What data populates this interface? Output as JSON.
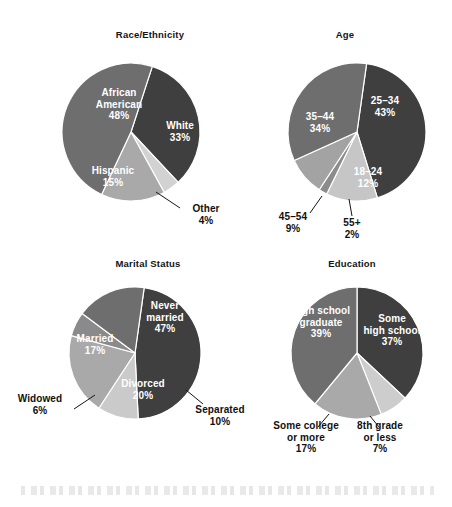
{
  "figure": {
    "width": 452,
    "height": 507,
    "background": "#ffffff"
  },
  "palette": {
    "darkest": "#3f3f3f",
    "dark": "#4a4a4a",
    "medium": "#6e6e6e",
    "light": "#9a9a9a",
    "lighter": "#b6b6b6",
    "lightest": "#d2d2d2",
    "label_light": "#ffffff",
    "label_dark": "#101010",
    "leader_line": "#141414"
  },
  "chart_data": [
    {
      "type": "pie",
      "title": "Race/Ethnicity",
      "center": {
        "x": 131,
        "y": 132
      },
      "radius": 69,
      "start_angle": 18,
      "direction": "clockwise",
      "labels": [
        "White",
        "Other",
        "Hispanic",
        "African American"
      ],
      "values": [
        33,
        4,
        15,
        48
      ],
      "slices": [
        {
          "label": "White",
          "value": 33,
          "value_text": "33%",
          "color": "#3f3f3f",
          "label_placement": "inside",
          "label_color": "#ffffff",
          "label_x": 180,
          "label_y": 131,
          "leader": null
        },
        {
          "label": "Other",
          "value": 4,
          "value_text": "4%",
          "color": "#d2d2d2",
          "label_placement": "outside",
          "label_color": "#101010",
          "label_x": 206,
          "label_y": 214,
          "leader": {
            "x1": 156,
            "y1": 192,
            "x2": 180,
            "y2": 208
          }
        },
        {
          "label": "Hispanic",
          "value": 15,
          "value_text": "15%",
          "color": "#a9a9a9",
          "label_placement": "inside",
          "label_color": "#ffffff",
          "label_x": 113,
          "label_y": 176,
          "leader": null
        },
        {
          "label": "African American",
          "value": 48,
          "value_text": "48%",
          "color": "#6e6e6e",
          "label_placement": "inside",
          "label_color": "#ffffff",
          "label_x": 119,
          "label_y": 104,
          "leader": null
        }
      ]
    },
    {
      "type": "pie",
      "title": "Age",
      "center": {
        "x": 357,
        "y": 132
      },
      "radius": 69,
      "start_angle": 8,
      "direction": "clockwise",
      "labels": [
        "25–34",
        "18–24",
        "55+",
        "45–54",
        "35–44"
      ],
      "values": [
        43,
        12,
        2,
        9,
        34
      ],
      "slices": [
        {
          "label": "25–34",
          "value": 43,
          "value_text": "43%",
          "color": "#3f3f3f",
          "label_placement": "inside",
          "label_color": "#ffffff",
          "label_x": 385,
          "label_y": 106,
          "leader": null
        },
        {
          "label": "18–24",
          "value": 12,
          "value_text": "12%",
          "color": "#c6c6c6",
          "label_placement": "inside",
          "label_color": "#ffffff",
          "label_x": 368,
          "label_y": 177,
          "leader": null
        },
        {
          "label": "55+",
          "value": 2,
          "value_text": "2%",
          "color": "#8c8c8c",
          "label_placement": "outside",
          "label_color": "#101010",
          "label_x": 352,
          "label_y": 228,
          "leader": {
            "x1": 349,
            "y1": 199,
            "x2": 352,
            "y2": 216
          }
        },
        {
          "label": "45–54",
          "value": 9,
          "value_text": "9%",
          "color": "#a3a3a3",
          "label_placement": "outside",
          "label_color": "#101010",
          "label_x": 293,
          "label_y": 222,
          "leader": {
            "x1": 322,
            "y1": 196,
            "x2": 310,
            "y2": 213
          }
        },
        {
          "label": "35–44",
          "value": 34,
          "value_text": "34%",
          "color": "#6e6e6e",
          "label_placement": "inside",
          "label_color": "#ffffff",
          "label_x": 320,
          "label_y": 122,
          "leader": null
        }
      ]
    },
    {
      "type": "pie",
      "title": "Marital Status",
      "center": {
        "x": 135,
        "y": 353
      },
      "radius": 66,
      "start_angle": 8,
      "direction": "clockwise",
      "labels": [
        "Never married",
        "Separated",
        "Divorced",
        "Widowed",
        "Married"
      ],
      "values": [
        47,
        10,
        20,
        6,
        17
      ],
      "slices": [
        {
          "label": "Never married",
          "value": 47,
          "value_text": "47%",
          "color": "#3f3f3f",
          "label_placement": "inside",
          "label_color": "#ffffff",
          "label_x": 165,
          "label_y": 317,
          "leader": null
        },
        {
          "label": "Separated",
          "value": 10,
          "value_text": "10%",
          "color": "#cacaca",
          "label_placement": "outside",
          "label_color": "#101010",
          "label_x": 220,
          "label_y": 415,
          "leader": {
            "x1": 186,
            "y1": 390,
            "x2": 203,
            "y2": 404
          }
        },
        {
          "label": "Divorced",
          "value": 20,
          "value_text": "20%",
          "color": "#a9a9a9",
          "label_placement": "inside",
          "label_color": "#ffffff",
          "label_x": 143,
          "label_y": 389,
          "leader": null
        },
        {
          "label": "Widowed",
          "value": 6,
          "value_text": "6%",
          "color": "#8a8a8a",
          "label_placement": "outside",
          "label_color": "#101010",
          "label_x": 40,
          "label_y": 404,
          "leader": {
            "x1": 95,
            "y1": 395,
            "x2": 74,
            "y2": 409
          }
        },
        {
          "label": "Married",
          "value": 17,
          "value_text": "17%",
          "color": "#6e6e6e",
          "label_placement": "inside",
          "label_color": "#ffffff",
          "label_x": 95,
          "label_y": 344,
          "leader": null
        }
      ]
    },
    {
      "type": "pie",
      "title": "Education",
      "center": {
        "x": 357,
        "y": 353
      },
      "radius": 66,
      "start_angle": 0,
      "direction": "clockwise",
      "labels": [
        "Some high school",
        "8th grade or less",
        "Some college or more",
        "High school graduate"
      ],
      "values": [
        37,
        7,
        17,
        39
      ],
      "slices": [
        {
          "label": "Some high school",
          "value": 37,
          "value_text": "37%",
          "color": "#3f3f3f",
          "label_placement": "inside",
          "label_color": "#ffffff",
          "label_x": 392,
          "label_y": 330,
          "leader": null
        },
        {
          "label": "8th grade or less",
          "value": 7,
          "value_text": "7%",
          "color": "#cdcdcd",
          "label_placement": "outside",
          "label_color": "#101010",
          "label_x": 380,
          "label_y": 437,
          "leader": {
            "x1": 370,
            "y1": 416,
            "x2": 379,
            "y2": 427
          }
        },
        {
          "label": "Some college or more",
          "value": 17,
          "value_text": "17%",
          "color": "#a9a9a9",
          "label_placement": "outside",
          "label_color": "#101010",
          "label_x": 306,
          "label_y": 437,
          "leader": {
            "x1": 329,
            "y1": 414,
            "x2": 318,
            "y2": 427
          }
        },
        {
          "label": "High school graduate",
          "value": 39,
          "value_text": "39%",
          "color": "#6e6e6e",
          "label_placement": "inside",
          "label_color": "#ffffff",
          "label_x": 321,
          "label_y": 322,
          "leader": null
        }
      ]
    }
  ],
  "titles": {
    "race": "Race/Ethnicity",
    "age": "Age",
    "marital": "Marital Status",
    "education": "Education"
  },
  "title_positions": [
    {
      "x": 150,
      "y": 29
    },
    {
      "x": 345,
      "y": 29
    },
    {
      "x": 148,
      "y": 258
    },
    {
      "x": 352,
      "y": 258
    }
  ]
}
